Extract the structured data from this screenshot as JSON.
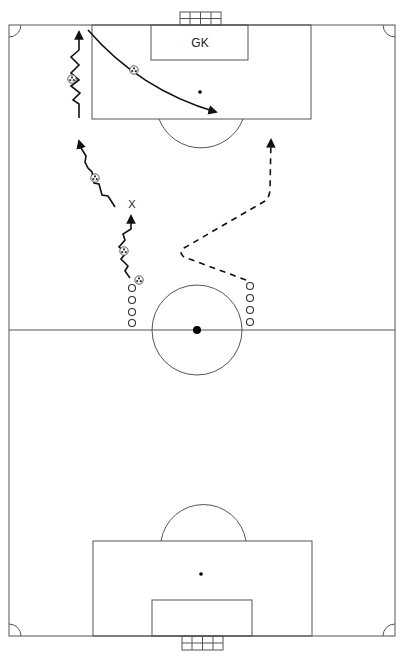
{
  "diagram": {
    "type": "soccer-drill",
    "labels": {
      "goalkeeper": "GK",
      "defender_marker": "X"
    },
    "colors": {
      "background": "#ffffff",
      "pitch_lines": "#555555",
      "movement_lines": "#111111"
    },
    "elements": {
      "players_left_queue": 4,
      "players_right_queue": 4,
      "balls": 5,
      "dribble_paths": 3,
      "runs_without_ball": 1,
      "passes": 1
    }
  }
}
